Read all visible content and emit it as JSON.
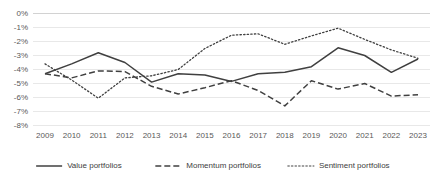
{
  "chart_data": {
    "type": "line",
    "title": "",
    "xlabel": "",
    "ylabel": "",
    "grid": true,
    "legend_position": "bottom",
    "categories": [
      "2009",
      "2010",
      "2011",
      "2012",
      "2013",
      "2014",
      "2015",
      "2016",
      "2017",
      "2018",
      "2019",
      "2020",
      "2021",
      "2022",
      "2023"
    ],
    "x": [
      2009,
      2010,
      2011,
      2012,
      2013,
      2014,
      2015,
      2016,
      2017,
      2018,
      2019,
      2020,
      2021,
      2022,
      2023
    ],
    "ylim": [
      -8,
      0
    ],
    "ytick_labels": [
      "0%",
      "-1%",
      "-2%",
      "-3%",
      "-4%",
      "-5%",
      "-6%",
      "-7%",
      "-8%"
    ],
    "ytick_values": [
      0,
      -1,
      -2,
      -3,
      -4,
      -5,
      -6,
      -7,
      -8
    ],
    "series": [
      {
        "name": "Value portfolios",
        "style": "solid",
        "color": "#404040",
        "values": [
          -4.3,
          -3.6,
          -2.8,
          -3.5,
          -4.9,
          -4.3,
          -4.4,
          -4.85,
          -4.3,
          -4.2,
          -3.8,
          -2.45,
          -3.0,
          -4.2,
          -3.25
        ]
      },
      {
        "name": "Momentum portfolios",
        "style": "dashed",
        "color": "#404040",
        "values": [
          -4.3,
          -4.6,
          -4.1,
          -4.15,
          -5.2,
          -5.75,
          -5.3,
          -4.8,
          -5.5,
          -6.6,
          -4.8,
          -5.4,
          -5.0,
          -5.9,
          -5.8
        ]
      },
      {
        "name": "Sentiment portfolios",
        "style": "dotted",
        "color": "#808080",
        "values": [
          -3.6,
          -4.75,
          -6.05,
          -4.6,
          -4.45,
          -4.0,
          -2.5,
          -1.55,
          -1.45,
          -2.2,
          -1.6,
          -1.05,
          -1.85,
          -2.6,
          -3.2
        ]
      }
    ],
    "legend": [
      {
        "label": "Value portfolios",
        "style": "solid"
      },
      {
        "label": "Momentum portfolios",
        "style": "dashed"
      },
      {
        "label": "Sentiment portfolios",
        "style": "dotted"
      }
    ]
  },
  "colors": {
    "grid": "#d9d9d9",
    "axis": "#bfbfbf",
    "text": "#595959",
    "value_series": "#404040",
    "momentum_series": "#404040",
    "sentiment_series": "#808080",
    "background": "#ffffff"
  }
}
